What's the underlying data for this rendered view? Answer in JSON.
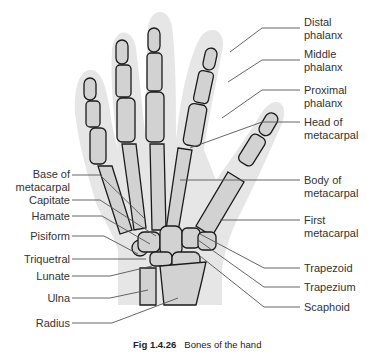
{
  "figure": {
    "caption_number": "Fig 1.4.26",
    "caption_text": "Bones of the hand",
    "colors": {
      "background": "#ffffff",
      "skin": "#e6e6e6",
      "bone": "#d2d2d2",
      "outline": "#1a1a1a",
      "leader": "#555555",
      "text": "#333333"
    }
  },
  "labels_right": [
    {
      "line1": "Distal",
      "line2": "phalanx"
    },
    {
      "line1": "Middle",
      "line2": "phalanx"
    },
    {
      "line1": "Proximal",
      "line2": "phalanx"
    },
    {
      "line1": "Head of",
      "line2": "metacarpal"
    },
    {
      "line1": "Body of",
      "line2": "metacarpal"
    },
    {
      "line1": "First",
      "line2": "metacarpal"
    },
    {
      "line1": "Trapezoid",
      "line2": ""
    },
    {
      "line1": "Trapezium",
      "line2": ""
    },
    {
      "line1": "Scaphoid",
      "line2": ""
    }
  ],
  "labels_left": [
    {
      "line1": "Base of",
      "line2": "metacarpal"
    },
    {
      "line1": "Capitate",
      "line2": ""
    },
    {
      "line1": "Hamate",
      "line2": ""
    },
    {
      "line1": "Pisiform",
      "line2": ""
    },
    {
      "line1": "Triquetral",
      "line2": ""
    },
    {
      "line1": "Lunate",
      "line2": ""
    },
    {
      "line1": "Ulna",
      "line2": ""
    },
    {
      "line1": "Radius",
      "line2": ""
    }
  ]
}
